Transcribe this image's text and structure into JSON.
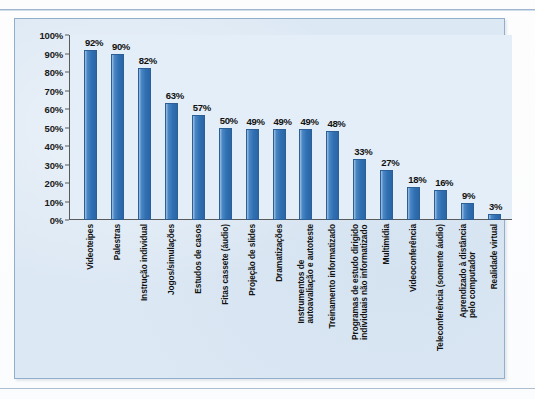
{
  "chart_data": {
    "type": "bar",
    "title": "",
    "xlabel": "",
    "ylabel": "",
    "ylim": [
      0,
      100
    ],
    "ytick_labels": [
      "100%",
      "90%",
      "80%",
      "70%",
      "60%",
      "50%",
      "40%",
      "30%",
      "20%",
      "10%",
      "0%"
    ],
    "ytick_values": [
      100,
      90,
      80,
      70,
      60,
      50,
      40,
      30,
      20,
      10,
      0
    ],
    "grid": false,
    "legend": "none",
    "bar_color": "#2f6fb2",
    "plot_background": "#e4eef8",
    "panel_background": "#dce8f4",
    "categories": [
      "Videoteipes",
      "Palestras",
      "Instrução individual",
      "Jogos/simulações",
      "Estudos de casos",
      "Fitas cassete (áudio)",
      "Projeção de slides",
      "Dramatizações",
      "Instrumentos de\nautoavaliação e autoteste",
      "Treinamento informatizado",
      "Programas de estudo dirigido\nindividuais não informatizado",
      "Multimídia",
      "Videoconferência",
      "Teleconferência (somente áudio)",
      "Aprendizado à distância\npelo computador",
      "Realidade virtual"
    ],
    "values": [
      92,
      90,
      82,
      63,
      57,
      50,
      49,
      49,
      49,
      48,
      33,
      27,
      18,
      16,
      9,
      3
    ],
    "data_labels": [
      "92%",
      "90%",
      "82%",
      "63%",
      "57%",
      "50%",
      "49%",
      "49%",
      "49%",
      "48%",
      "33%",
      "27%",
      "18%",
      "16%",
      "9%",
      "3%"
    ]
  }
}
